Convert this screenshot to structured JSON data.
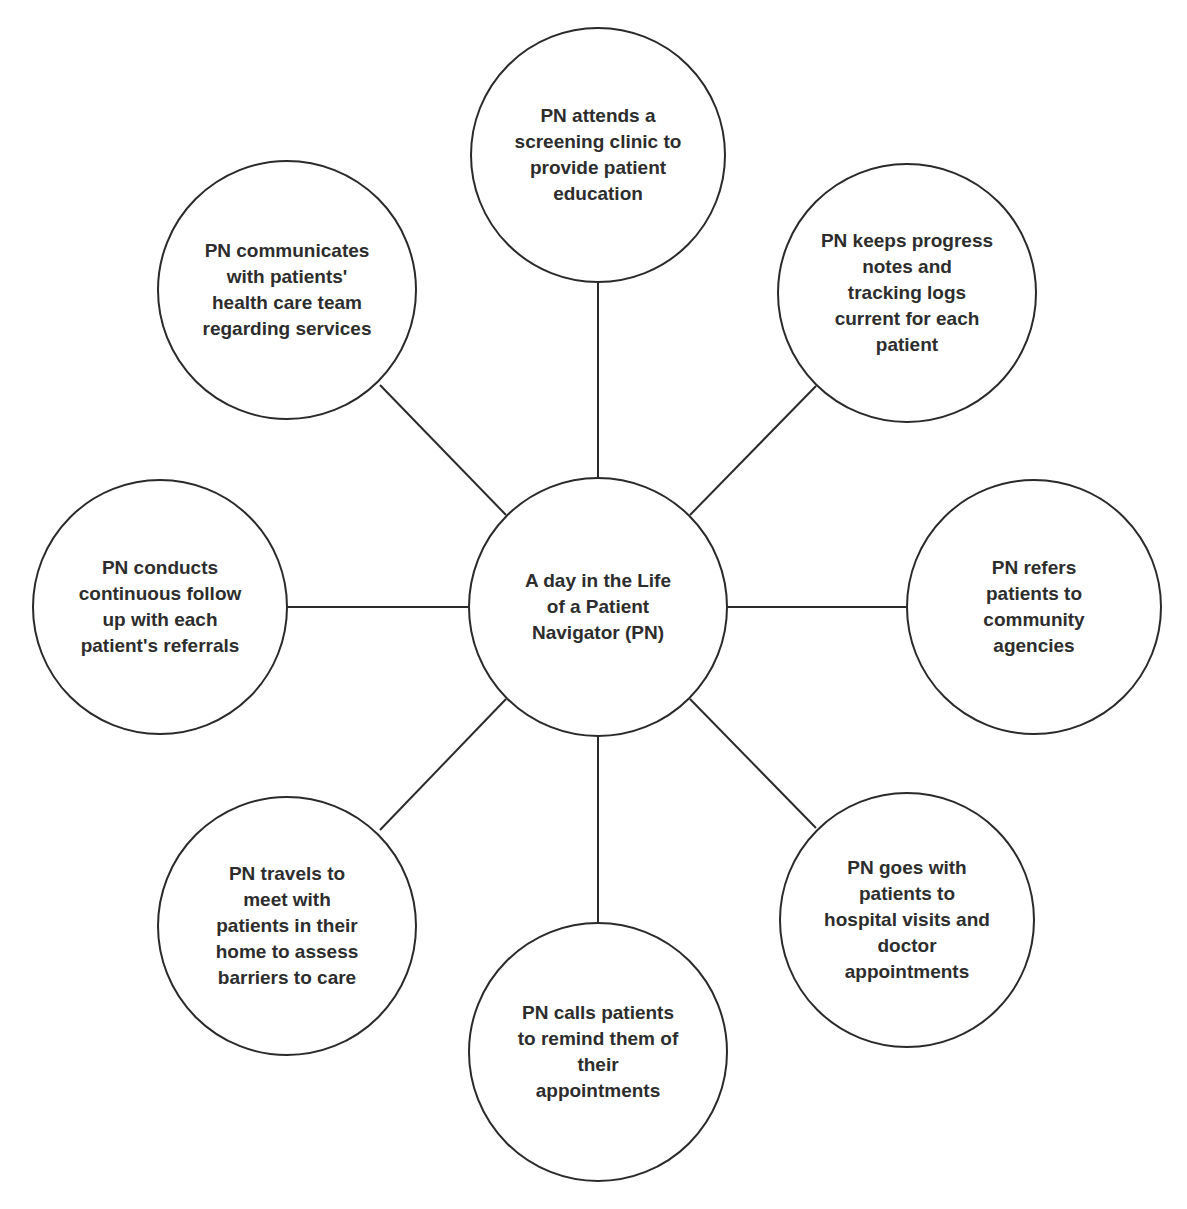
{
  "diagram": {
    "type": "hub-and-spoke",
    "center": {
      "id": "center",
      "text": "A day in the Life\nof a Patient\nNavigator (PN)",
      "cx": 598,
      "cy": 607,
      "r": 130
    },
    "nodes": [
      {
        "id": "top",
        "text": "PN attends a\nscreening clinic to\nprovide patient\neducation",
        "cx": 598,
        "cy": 155,
        "r": 128
      },
      {
        "id": "top-right",
        "text": "PN keeps progress\nnotes and\ntracking logs\ncurrent for each\npatient",
        "cx": 907,
        "cy": 293,
        "r": 130
      },
      {
        "id": "right",
        "text": "PN refers\npatients to\ncommunity\nagencies",
        "cx": 1034,
        "cy": 607,
        "r": 128
      },
      {
        "id": "bottom-right",
        "text": "PN goes with\npatients to\nhospital visits and\ndoctor\nappointments",
        "cx": 907,
        "cy": 920,
        "r": 128
      },
      {
        "id": "bottom",
        "text": "PN calls patients\nto remind them of\ntheir\nappointments",
        "cx": 598,
        "cy": 1052,
        "r": 130
      },
      {
        "id": "bottom-left",
        "text": "PN travels to\nmeet with\npatients in their\nhome to assess\nbarriers to care",
        "cx": 287,
        "cy": 926,
        "r": 130
      },
      {
        "id": "left",
        "text": "PN conducts\ncontinuous follow\nup with each\npatient's referrals",
        "cx": 160,
        "cy": 607,
        "r": 128
      },
      {
        "id": "top-left",
        "text": "PN communicates\nwith patients'\nhealth care team\nregarding services",
        "cx": 287,
        "cy": 290,
        "r": 130
      }
    ],
    "line_color": "#2a2a2a",
    "edge_color": "#2a2a2a"
  }
}
